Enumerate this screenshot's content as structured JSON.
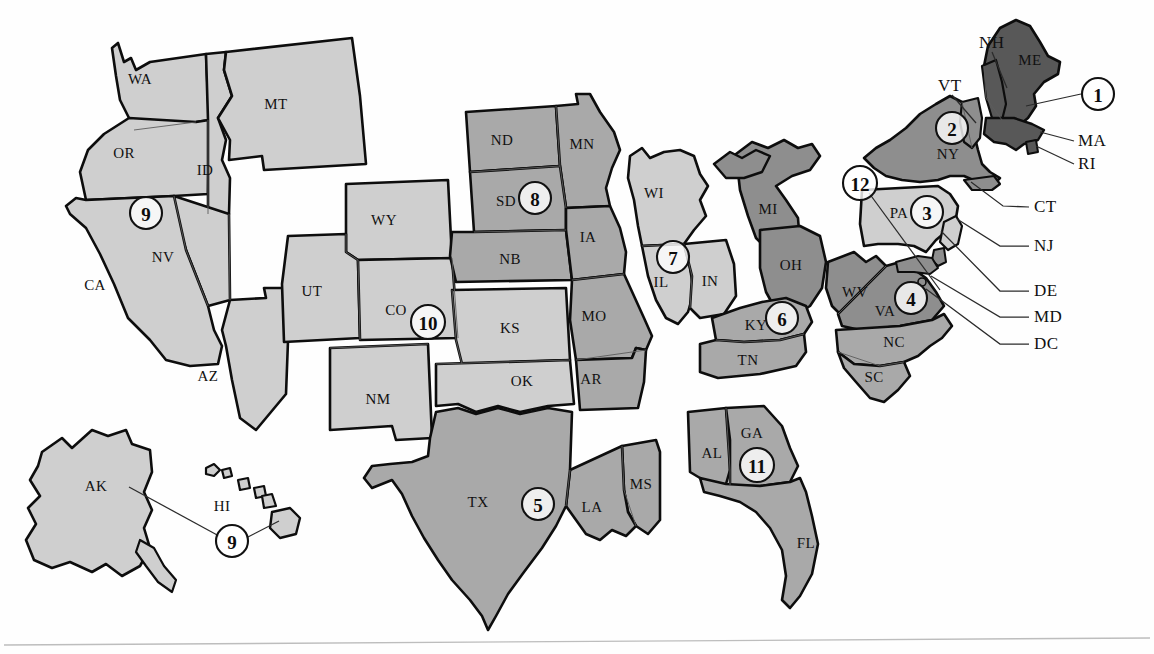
{
  "map": {
    "title": "Federal Reserve Districts of the United States",
    "width": 1154,
    "height": 654,
    "footer_rule": true
  },
  "palette": {
    "light": "#cfcfcf",
    "medium": "#a9a9a9",
    "medium_dark": "#8e8e8e",
    "dark": "#585858",
    "outline": "#0d0d0d",
    "inner_border": "#5c5c5c",
    "background": "#ffffff",
    "leader_line": "#2b2b2b",
    "footer_rule": "#bdbdbd"
  },
  "districts": [
    {
      "number": "1",
      "label": "1",
      "cx": 1098,
      "cy": 94,
      "tone": "dark",
      "region": "Boston"
    },
    {
      "number": "2",
      "label": "2",
      "cx": 952,
      "cy": 128,
      "tone": "medium_dark",
      "region": "New York"
    },
    {
      "number": "3",
      "label": "3",
      "cx": 927,
      "cy": 212,
      "tone": "light",
      "region": "Philadelphia"
    },
    {
      "number": "4",
      "label": "4",
      "cx": 911,
      "cy": 298,
      "tone": "medium_dark",
      "region": "Cleveland"
    },
    {
      "number": "5",
      "label": "5",
      "cx": 538,
      "cy": 504,
      "tone": "medium",
      "region": "Richmond"
    },
    {
      "number": "6",
      "label": "6",
      "cx": 782,
      "cy": 318,
      "tone": "medium",
      "region": "Atlanta"
    },
    {
      "number": "7",
      "label": "7",
      "cx": 673,
      "cy": 257,
      "tone": "light",
      "region": "Chicago"
    },
    {
      "number": "8",
      "label": "8",
      "cx": 535,
      "cy": 198,
      "tone": "medium",
      "region": "St. Louis"
    },
    {
      "number": "9",
      "label": "9",
      "cx": 146,
      "cy": 213,
      "tone": "light",
      "region": "Minneapolis"
    },
    {
      "number": "10",
      "label": "10",
      "cx": 428,
      "cy": 322,
      "tone": "light",
      "region": "Kansas City"
    },
    {
      "number": "11",
      "label": "11",
      "cx": 757,
      "cy": 465,
      "tone": "medium",
      "region": "Dallas"
    },
    {
      "number": "12",
      "label": "12",
      "cx": 860,
      "cy": 183,
      "tone": "light",
      "region": "San Francisco"
    },
    {
      "number": "9b",
      "label": "9",
      "cx": 232,
      "cy": 541,
      "tone": "light",
      "region": "Hawaii inset"
    }
  ],
  "states": [
    {
      "abbr": "WA",
      "x": 140,
      "y": 81,
      "tone": "light"
    },
    {
      "abbr": "MT",
      "x": 276,
      "y": 106,
      "tone": "light"
    },
    {
      "abbr": "OR",
      "x": 124,
      "y": 155,
      "tone": "light"
    },
    {
      "abbr": "ID",
      "x": 205,
      "y": 172,
      "tone": "light"
    },
    {
      "abbr": "NV",
      "x": 163,
      "y": 259,
      "tone": "light"
    },
    {
      "abbr": "CA",
      "x": 95,
      "y": 287,
      "tone": "light"
    },
    {
      "abbr": "AZ",
      "x": 208,
      "y": 378,
      "tone": "light"
    },
    {
      "abbr": "WY",
      "x": 384,
      "y": 222,
      "tone": "light"
    },
    {
      "abbr": "UT",
      "x": 312,
      "y": 293,
      "tone": "light"
    },
    {
      "abbr": "CO",
      "x": 396,
      "y": 312,
      "tone": "light"
    },
    {
      "abbr": "NM",
      "x": 378,
      "y": 401,
      "tone": "light"
    },
    {
      "abbr": "ND",
      "x": 502,
      "y": 142,
      "tone": "medium"
    },
    {
      "abbr": "MN",
      "x": 582,
      "y": 146,
      "tone": "medium"
    },
    {
      "abbr": "SD",
      "x": 506,
      "y": 203,
      "tone": "medium"
    },
    {
      "abbr": "NB",
      "x": 510,
      "y": 261,
      "tone": "medium"
    },
    {
      "abbr": "IA",
      "x": 588,
      "y": 239,
      "tone": "medium"
    },
    {
      "abbr": "KS",
      "x": 510,
      "y": 330,
      "tone": "light"
    },
    {
      "abbr": "OK",
      "x": 522,
      "y": 383,
      "tone": "light"
    },
    {
      "abbr": "MO",
      "x": 594,
      "y": 318,
      "tone": "medium"
    },
    {
      "abbr": "AR",
      "x": 591,
      "y": 381,
      "tone": "medium"
    },
    {
      "abbr": "WI",
      "x": 654,
      "y": 195,
      "tone": "light"
    },
    {
      "abbr": "IL",
      "x": 661,
      "y": 284,
      "tone": "light"
    },
    {
      "abbr": "IN",
      "x": 710,
      "y": 283,
      "tone": "light"
    },
    {
      "abbr": "MI",
      "x": 768,
      "y": 211,
      "tone": "medium_dark"
    },
    {
      "abbr": "OH",
      "x": 791,
      "y": 267,
      "tone": "medium_dark"
    },
    {
      "abbr": "KY",
      "x": 756,
      "y": 327,
      "tone": "medium"
    },
    {
      "abbr": "TN",
      "x": 748,
      "y": 362,
      "tone": "medium"
    },
    {
      "abbr": "WV",
      "x": 855,
      "y": 294,
      "tone": "medium_dark"
    },
    {
      "abbr": "VA",
      "x": 885,
      "y": 313,
      "tone": "medium_dark"
    },
    {
      "abbr": "NC",
      "x": 894,
      "y": 344,
      "tone": "medium"
    },
    {
      "abbr": "SC",
      "x": 874,
      "y": 379,
      "tone": "medium"
    },
    {
      "abbr": "GA",
      "x": 752,
      "y": 435,
      "tone": "medium"
    },
    {
      "abbr": "AL",
      "x": 712,
      "y": 455,
      "tone": "medium"
    },
    {
      "abbr": "FL",
      "x": 806,
      "y": 545,
      "tone": "medium"
    },
    {
      "abbr": "MS",
      "x": 641,
      "y": 486,
      "tone": "medium"
    },
    {
      "abbr": "LA",
      "x": 592,
      "y": 509,
      "tone": "medium"
    },
    {
      "abbr": "TX",
      "x": 478,
      "y": 504,
      "tone": "medium"
    },
    {
      "abbr": "PA",
      "x": 899,
      "y": 215,
      "tone": "light"
    },
    {
      "abbr": "NY",
      "x": 948,
      "y": 156,
      "tone": "medium_dark"
    },
    {
      "abbr": "ME",
      "x": 1030,
      "y": 62,
      "tone": "dark"
    },
    {
      "abbr": "AK",
      "x": 96,
      "y": 488,
      "tone": "light"
    },
    {
      "abbr": "HI",
      "x": 222,
      "y": 508,
      "tone": "light"
    }
  ],
  "callouts": [
    {
      "abbr": "NH",
      "label_x": 979,
      "label_y": 44,
      "line": "M 992 52 L 1007 88"
    },
    {
      "abbr": "VT",
      "label_x": 938,
      "label_y": 87,
      "line": "M 952 95 L 976 123"
    },
    {
      "abbr": "MA",
      "label_x": 1078,
      "label_y": 142,
      "line": "M 1074 141 L 1040 132"
    },
    {
      "abbr": "RI",
      "label_x": 1078,
      "label_y": 165,
      "line": "M 1074 164 L 1036 146"
    },
    {
      "abbr": "CT",
      "label_x": 1034,
      "label_y": 208,
      "line": "M 1029 207 L 1003 206 L 971 182"
    },
    {
      "abbr": "NJ",
      "label_x": 1034,
      "label_y": 247,
      "line": "M 1029 246 L 1000 246 L 957 219"
    },
    {
      "abbr": "DE",
      "label_x": 1034,
      "label_y": 292,
      "line": "M 1029 291 L 1000 291 L 941 231"
    },
    {
      "abbr": "MD",
      "label_x": 1034,
      "label_y": 318,
      "line": "M 1029 317 L 1000 317 L 931 276"
    },
    {
      "abbr": "DC",
      "label_x": 1034,
      "label_y": 345,
      "line": "M 1029 344 L 1000 344 L 926 289"
    }
  ],
  "leader_lines": [
    {
      "name": "district-1-leader",
      "path": "M 1081 94 L 1026 106"
    },
    {
      "name": "district-12-leader",
      "path": "M 869 193 L 940 290"
    },
    {
      "name": "hawaii-9-leader",
      "path": "M 219 536 L 129 487"
    },
    {
      "name": "hawaii-island-leader",
      "path": "M 246 538 L 279 521"
    }
  ]
}
